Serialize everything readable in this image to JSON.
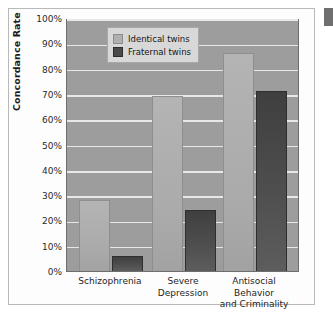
{
  "chart_data": {
    "type": "bar",
    "title": "",
    "xlabel": "",
    "ylabel": "Concordance Rate",
    "ylim": [
      0,
      100
    ],
    "ytick_labels": [
      "100%",
      "90%",
      "80%",
      "70%",
      "60%",
      "50%",
      "40%",
      "30%",
      "20%",
      "10%",
      "0%"
    ],
    "ytick_values": [
      100,
      90,
      80,
      70,
      60,
      50,
      40,
      30,
      20,
      10,
      0
    ],
    "grid": true,
    "legend_position": "top-left",
    "categories": [
      [
        "Schizophrenia"
      ],
      [
        "Severe",
        "Depression"
      ],
      [
        "Antisocial Behavior",
        "and Criminality"
      ]
    ],
    "series": [
      {
        "name": "Identical twins",
        "color": "#aaaaaa",
        "values": [
          28,
          69,
          86
        ]
      },
      {
        "name": "Fraternal twins",
        "color": "#4e4e4e",
        "values": [
          6,
          24,
          71
        ]
      }
    ]
  },
  "figure": {
    "plot_background_color": "#9d9d9d",
    "gridline_color": "#e8e8e8",
    "frame_color": "#b9b9b9"
  }
}
